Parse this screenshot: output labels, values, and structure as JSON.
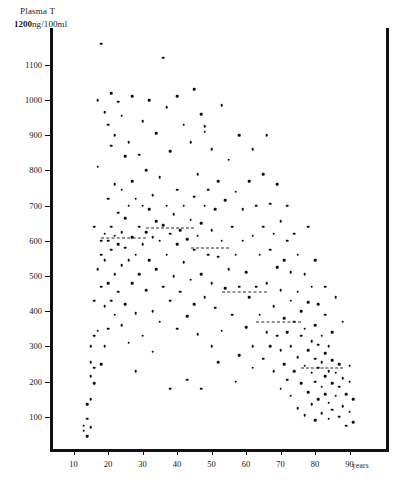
{
  "header": {
    "title": "Plasma T",
    "top_value": "1200",
    "units": "ng/100ml"
  },
  "axes": {
    "x_unit_label": "years",
    "y_ticks": [
      1100,
      1000,
      900,
      800,
      700,
      600,
      500,
      400,
      300,
      200,
      100
    ],
    "x_ticks": [
      10,
      20,
      30,
      40,
      50,
      60,
      70,
      80,
      90
    ]
  },
  "chart_data": {
    "type": "scatter",
    "title": "Plasma T",
    "xlabel": "years",
    "ylabel": "Plasma T (ng/100ml)",
    "xlim": [
      0,
      96
    ],
    "ylim": [
      0,
      1200
    ],
    "grid": false,
    "legend": null,
    "marker": "filled-circle",
    "marker_color": "#0d0d0d",
    "series": [
      {
        "name": "Plasma testosterone vs age",
        "points": [
          [
            13,
            60
          ],
          [
            13,
            75
          ],
          [
            14,
            95
          ],
          [
            14,
            45
          ],
          [
            14,
            135
          ],
          [
            15,
            150
          ],
          [
            15,
            215
          ],
          [
            15,
            255
          ],
          [
            15,
            300
          ],
          [
            15,
            70
          ],
          [
            16,
            195
          ],
          [
            16,
            240
          ],
          [
            16,
            330
          ],
          [
            16,
            430
          ],
          [
            16,
            640
          ],
          [
            17,
            345
          ],
          [
            17,
            520
          ],
          [
            17,
            810
          ],
          [
            17,
            1000
          ],
          [
            18,
            250
          ],
          [
            18,
            470
          ],
          [
            18,
            560
          ],
          [
            18,
            600
          ],
          [
            18,
            1160
          ],
          [
            19,
            300
          ],
          [
            19,
            415
          ],
          [
            19,
            545
          ],
          [
            19,
            620
          ],
          [
            19,
            965
          ],
          [
            20,
            350
          ],
          [
            20,
            480
          ],
          [
            20,
            600
          ],
          [
            20,
            720
          ],
          [
            20,
            930
          ],
          [
            21,
            430
          ],
          [
            21,
            575
          ],
          [
            21,
            640
          ],
          [
            21,
            870
          ],
          [
            21,
            1020
          ],
          [
            22,
            390
          ],
          [
            22,
            505
          ],
          [
            22,
            615
          ],
          [
            22,
            760
          ],
          [
            22,
            900
          ],
          [
            23,
            455
          ],
          [
            23,
            590
          ],
          [
            23,
            680
          ],
          [
            23,
            995
          ],
          [
            24,
            360
          ],
          [
            24,
            530
          ],
          [
            24,
            625
          ],
          [
            24,
            745
          ],
          [
            24,
            955
          ],
          [
            25,
            420
          ],
          [
            25,
            580
          ],
          [
            25,
            665
          ],
          [
            25,
            840
          ],
          [
            26,
            310
          ],
          [
            26,
            545
          ],
          [
            26,
            700
          ],
          [
            26,
            880
          ],
          [
            27,
            480
          ],
          [
            27,
            610
          ],
          [
            27,
            770
          ],
          [
            27,
            1010
          ],
          [
            28,
            395
          ],
          [
            28,
            560
          ],
          [
            28,
            720
          ],
          [
            29,
            505
          ],
          [
            29,
            640
          ],
          [
            29,
            845
          ],
          [
            30,
            330
          ],
          [
            30,
            590
          ],
          [
            30,
            700
          ],
          [
            30,
            940
          ],
          [
            31,
            460
          ],
          [
            31,
            625
          ],
          [
            31,
            800
          ],
          [
            32,
            545
          ],
          [
            32,
            690
          ],
          [
            32,
            1000
          ],
          [
            33,
            400
          ],
          [
            33,
            610
          ],
          [
            33,
            730
          ],
          [
            34,
            520
          ],
          [
            34,
            655
          ],
          [
            34,
            905
          ],
          [
            35,
            370
          ],
          [
            35,
            600
          ],
          [
            35,
            780
          ],
          [
            36,
            470
          ],
          [
            36,
            645
          ],
          [
            37,
            560
          ],
          [
            37,
            700
          ],
          [
            37,
            980
          ],
          [
            38,
            430
          ],
          [
            38,
            620
          ],
          [
            38,
            855
          ],
          [
            39,
            500
          ],
          [
            39,
            675
          ],
          [
            40,
            350
          ],
          [
            40,
            590
          ],
          [
            40,
            745
          ],
          [
            40,
            1010
          ],
          [
            41,
            455
          ],
          [
            41,
            630
          ],
          [
            42,
            540
          ],
          [
            42,
            700
          ],
          [
            42,
            930
          ],
          [
            43,
            385
          ],
          [
            43,
            605
          ],
          [
            44,
            490
          ],
          [
            44,
            660
          ],
          [
            44,
            880
          ],
          [
            45,
            420
          ],
          [
            45,
            575
          ],
          [
            45,
            725
          ],
          [
            45,
            1030
          ],
          [
            46,
            335
          ],
          [
            46,
            615
          ],
          [
            46,
            790
          ],
          [
            47,
            505
          ],
          [
            47,
            650
          ],
          [
            47,
            960
          ],
          [
            48,
            440
          ],
          [
            48,
            700
          ],
          [
            48,
            910
          ],
          [
            48,
            925
          ],
          [
            49,
            560
          ],
          [
            49,
            745
          ],
          [
            50,
            300
          ],
          [
            50,
            480
          ],
          [
            50,
            630
          ],
          [
            50,
            860
          ],
          [
            51,
            410
          ],
          [
            51,
            690
          ],
          [
            52,
            555
          ],
          [
            52,
            770
          ],
          [
            53,
            345
          ],
          [
            53,
            600
          ],
          [
            53,
            985
          ],
          [
            54,
            465
          ],
          [
            54,
            715
          ],
          [
            55,
            520
          ],
          [
            55,
            830
          ],
          [
            56,
            390
          ],
          [
            56,
            640
          ],
          [
            57,
            560
          ],
          [
            57,
            740
          ],
          [
            58,
            275
          ],
          [
            58,
            470
          ],
          [
            58,
            900
          ],
          [
            59,
            600
          ],
          [
            59,
            690
          ],
          [
            60,
            355
          ],
          [
            60,
            510
          ],
          [
            61,
            440
          ],
          [
            61,
            770
          ],
          [
            62,
            300
          ],
          [
            62,
            615
          ],
          [
            62,
            860
          ],
          [
            63,
            470
          ],
          [
            63,
            700
          ],
          [
            64,
            390
          ],
          [
            64,
            560
          ],
          [
            65,
            265
          ],
          [
            65,
            640
          ],
          [
            65,
            790
          ],
          [
            66,
            340
          ],
          [
            66,
            480
          ],
          [
            66,
            900
          ],
          [
            67,
            300
          ],
          [
            67,
            575
          ],
          [
            67,
            705
          ],
          [
            68,
            230
          ],
          [
            68,
            415
          ],
          [
            68,
            620
          ],
          [
            69,
            330
          ],
          [
            69,
            525
          ],
          [
            69,
            760
          ],
          [
            70,
            180
          ],
          [
            70,
            290
          ],
          [
            70,
            460
          ],
          [
            70,
            655
          ],
          [
            71,
            250
          ],
          [
            71,
            380
          ],
          [
            71,
            545
          ],
          [
            72,
            205
          ],
          [
            72,
            340
          ],
          [
            72,
            600
          ],
          [
            72,
            700
          ],
          [
            73,
            160
          ],
          [
            73,
            300
          ],
          [
            73,
            430
          ],
          [
            73,
            510
          ],
          [
            74,
            230
          ],
          [
            74,
            370
          ],
          [
            74,
            620
          ],
          [
            75,
            125
          ],
          [
            75,
            270
          ],
          [
            75,
            455
          ],
          [
            75,
            560
          ],
          [
            76,
            195
          ],
          [
            76,
            330
          ],
          [
            76,
            400
          ],
          [
            77,
            105
          ],
          [
            77,
            245
          ],
          [
            77,
            350
          ],
          [
            77,
            505
          ],
          [
            78,
            170
          ],
          [
            78,
            290
          ],
          [
            78,
            425
          ],
          [
            78,
            640
          ],
          [
            79,
            135
          ],
          [
            79,
            225
          ],
          [
            79,
            315
          ],
          [
            79,
            470
          ],
          [
            80,
            90
          ],
          [
            80,
            200
          ],
          [
            80,
            265
          ],
          [
            80,
            360
          ],
          [
            80,
            545
          ],
          [
            81,
            150
          ],
          [
            81,
            240
          ],
          [
            81,
            305
          ],
          [
            81,
            420
          ],
          [
            82,
            110
          ],
          [
            82,
            185
          ],
          [
            82,
            255
          ],
          [
            82,
            330
          ],
          [
            83,
            165
          ],
          [
            83,
            215
          ],
          [
            83,
            280
          ],
          [
            83,
            390
          ],
          [
            83,
            470
          ],
          [
            84,
            95
          ],
          [
            84,
            140
          ],
          [
            84,
            230
          ],
          [
            84,
            300
          ],
          [
            85,
            120
          ],
          [
            85,
            195
          ],
          [
            85,
            260
          ],
          [
            85,
            340
          ],
          [
            86,
            160
          ],
          [
            86,
            225
          ],
          [
            86,
            440
          ],
          [
            87,
            100
          ],
          [
            87,
            185
          ],
          [
            87,
            250
          ],
          [
            88,
            130
          ],
          [
            88,
            210
          ],
          [
            88,
            370
          ],
          [
            89,
            75
          ],
          [
            89,
            165
          ],
          [
            90,
            115
          ],
          [
            90,
            200
          ],
          [
            90,
            245
          ],
          [
            91,
            85
          ],
          [
            91,
            150
          ],
          [
            43,
            205
          ],
          [
            52,
            255
          ],
          [
            62,
            240
          ],
          [
            28,
            230
          ],
          [
            33,
            285
          ],
          [
            38,
            180
          ],
          [
            47,
            180
          ],
          [
            57,
            200
          ],
          [
            36,
            1120
          ]
        ]
      }
    ],
    "mean_lines": [
      {
        "label": "decade mean 20-30",
        "x_start": 18,
        "x_end": 31,
        "y": 608
      },
      {
        "label": "decade mean 30-40",
        "x_start": 31,
        "x_end": 45,
        "y": 635
      },
      {
        "label": "decade mean 40-50",
        "x_start": 44,
        "x_end": 55,
        "y": 580
      },
      {
        "label": "decade mean 50-60",
        "x_start": 53,
        "x_end": 66,
        "y": 455
      },
      {
        "label": "decade mean 70-80",
        "x_start": 63,
        "x_end": 76,
        "y": 370
      },
      {
        "label": "decade mean 80-90",
        "x_start": 76,
        "x_end": 88,
        "y": 240
      }
    ]
  }
}
